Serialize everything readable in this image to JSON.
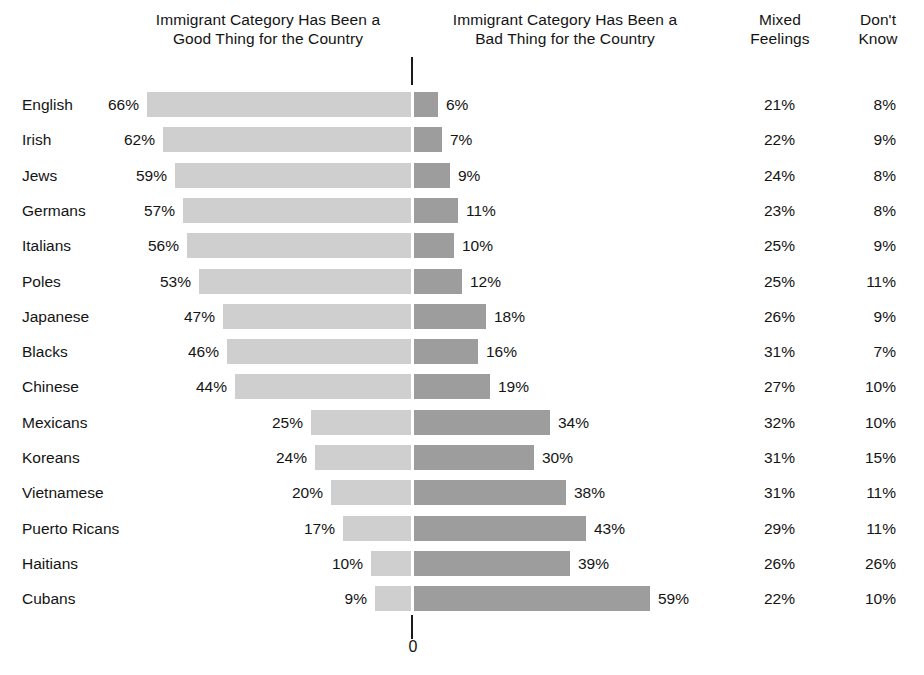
{
  "headers": {
    "good": "Immigrant Category Has Been a\nGood Thing for the Country",
    "good_line1": "Immigrant Category Has Been a",
    "good_line2": "Good Thing for the Country",
    "bad_line1": "Immigrant Category Has Been a",
    "bad_line2": "Bad Thing for the Country",
    "mixed_line1": "Mixed",
    "mixed_line2": "Feelings",
    "dontknow_line1": "Don't",
    "dontknow_line2": "Know"
  },
  "axis": {
    "zero_label": "0"
  },
  "colors": {
    "good_bar": "#cfcfcf",
    "bad_bar": "#9d9d9d",
    "text": "#141414",
    "background": "#ffffff"
  },
  "chart_data": {
    "type": "bar",
    "title": "",
    "subtitle": "",
    "orientation": "horizontal-diverging",
    "xlabel": "",
    "ylabel": "",
    "grid": false,
    "legend_position": "top-as-column-headers",
    "axis_origin_label": "0",
    "categories": [
      "English",
      "Irish",
      "Jews",
      "Germans",
      "Italians",
      "Poles",
      "Japanese",
      "Blacks",
      "Chinese",
      "Mexicans",
      "Koreans",
      "Vietnamese",
      "Puerto Ricans",
      "Haitians",
      "Cubans"
    ],
    "series": [
      {
        "name": "Immigrant Category Has Been a Good Thing for the Country",
        "direction": "left",
        "values": [
          66,
          62,
          59,
          57,
          56,
          53,
          47,
          46,
          44,
          25,
          24,
          20,
          17,
          10,
          9
        ],
        "labels": [
          "66%",
          "62%",
          "59%",
          "57%",
          "56%",
          "53%",
          "47%",
          "46%",
          "44%",
          "25%",
          "24%",
          "20%",
          "17%",
          "10%",
          "9%"
        ]
      },
      {
        "name": "Immigrant Category Has Been a Bad Thing for the Country",
        "direction": "right",
        "values": [
          6,
          7,
          9,
          11,
          10,
          12,
          18,
          16,
          19,
          34,
          30,
          38,
          43,
          39,
          59
        ],
        "labels": [
          "6%",
          "7%",
          "9%",
          "11%",
          "10%",
          "12%",
          "18%",
          "16%",
          "19%",
          "34%",
          "30%",
          "38%",
          "43%",
          "39%",
          "59%"
        ]
      },
      {
        "name": "Mixed Feelings",
        "direction": "text-column",
        "values": [
          21,
          22,
          24,
          23,
          25,
          25,
          26,
          31,
          27,
          32,
          31,
          31,
          29,
          26,
          22
        ],
        "labels": [
          "21%",
          "22%",
          "24%",
          "23%",
          "25%",
          "25%",
          "26%",
          "31%",
          "27%",
          "32%",
          "31%",
          "31%",
          "29%",
          "26%",
          "22%"
        ]
      },
      {
        "name": "Don't Know",
        "direction": "text-column",
        "values": [
          8,
          9,
          8,
          8,
          9,
          11,
          9,
          7,
          10,
          10,
          15,
          11,
          11,
          26,
          10
        ],
        "labels": [
          "8%",
          "9%",
          "8%",
          "8%",
          "9%",
          "11%",
          "9%",
          "7%",
          "10%",
          "10%",
          "15%",
          "11%",
          "11%",
          "26%",
          "10%"
        ]
      }
    ],
    "xlim": [
      -70,
      70
    ],
    "px_per_unit": 4.0
  },
  "rows": [
    {
      "category": "English",
      "good": 66,
      "good_label": "66%",
      "bad": 6,
      "bad_label": "6%",
      "mixed": "21%",
      "dk": "8%"
    },
    {
      "category": "Irish",
      "good": 62,
      "good_label": "62%",
      "bad": 7,
      "bad_label": "7%",
      "mixed": "22%",
      "dk": "9%"
    },
    {
      "category": "Jews",
      "good": 59,
      "good_label": "59%",
      "bad": 9,
      "bad_label": "9%",
      "mixed": "24%",
      "dk": "8%"
    },
    {
      "category": "Germans",
      "good": 57,
      "good_label": "57%",
      "bad": 11,
      "bad_label": "11%",
      "mixed": "23%",
      "dk": "8%"
    },
    {
      "category": "Italians",
      "good": 56,
      "good_label": "56%",
      "bad": 10,
      "bad_label": "10%",
      "mixed": "25%",
      "dk": "9%"
    },
    {
      "category": "Poles",
      "good": 53,
      "good_label": "53%",
      "bad": 12,
      "bad_label": "12%",
      "mixed": "25%",
      "dk": "11%"
    },
    {
      "category": "Japanese",
      "good": 47,
      "good_label": "47%",
      "bad": 18,
      "bad_label": "18%",
      "mixed": "26%",
      "dk": "9%"
    },
    {
      "category": "Blacks",
      "good": 46,
      "good_label": "46%",
      "bad": 16,
      "bad_label": "16%",
      "mixed": "31%",
      "dk": "7%"
    },
    {
      "category": "Chinese",
      "good": 44,
      "good_label": "44%",
      "bad": 19,
      "bad_label": "19%",
      "mixed": "27%",
      "dk": "10%"
    },
    {
      "category": "Mexicans",
      "good": 25,
      "good_label": "25%",
      "bad": 34,
      "bad_label": "34%",
      "mixed": "32%",
      "dk": "10%"
    },
    {
      "category": "Koreans",
      "good": 24,
      "good_label": "24%",
      "bad": 30,
      "bad_label": "30%",
      "mixed": "31%",
      "dk": "15%"
    },
    {
      "category": "Vietnamese",
      "good": 20,
      "good_label": "20%",
      "bad": 38,
      "bad_label": "38%",
      "mixed": "31%",
      "dk": "11%"
    },
    {
      "category": "Puerto Ricans",
      "good": 17,
      "good_label": "17%",
      "bad": 43,
      "bad_label": "43%",
      "mixed": "29%",
      "dk": "11%"
    },
    {
      "category": "Haitians",
      "good": 10,
      "good_label": "10%",
      "bad": 39,
      "bad_label": "39%",
      "mixed": "26%",
      "dk": "26%"
    },
    {
      "category": "Cubans",
      "good": 9,
      "good_label": "9%",
      "bad": 59,
      "bad_label": "59%",
      "mixed": "22%",
      "dk": "10%"
    }
  ],
  "layout": {
    "axis_x": 411,
    "row_top": 88,
    "row_step": 35.3,
    "px_per_percent": 4.0
  }
}
